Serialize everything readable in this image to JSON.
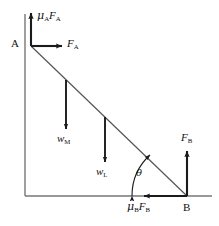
{
  "figure": {
    "background_color": "#ffffff",
    "stroke_color": "#1a1a1a",
    "structure_color": "#6e6e6e",
    "width": 219,
    "height": 226
  },
  "points": [
    {
      "id": "A",
      "label": "A",
      "description": "top contact point of ladder on vertical wall",
      "x": 31,
      "y": 46,
      "label_x": 12,
      "label_y": 39
    },
    {
      "id": "B",
      "label": "B",
      "description": "bottom contact point of ladder on ground",
      "x": 187,
      "y": 196,
      "label_x": 184,
      "label_y": 203
    }
  ],
  "ladder": {
    "name": "ladder-line",
    "from_point": "A",
    "to_point": "B",
    "x1": 31,
    "y1": 46,
    "x2": 187,
    "y2": 196
  },
  "structure": {
    "wall": {
      "x1": 25,
      "y1": 14,
      "x2": 25,
      "y2": 196
    },
    "ground": {
      "x1": 25,
      "y1": 196,
      "x2": 212,
      "y2": 196
    }
  },
  "angle": {
    "symbol": "θ",
    "label": "θ",
    "description": "angle between ladder and ground at B",
    "vertex_x": 187,
    "vertex_y": 196,
    "label_x": 136,
    "label_y": 173,
    "arc_radius": 55
  },
  "forces": [
    {
      "id": "muA_FA",
      "name": "friction-force-at-A",
      "symbol_mu": "μ",
      "symbol_mu_sub": "A",
      "symbol_f": "F",
      "symbol_f_sub": "A",
      "direction": "up",
      "x1": 31,
      "y1": 46,
      "x2": 31,
      "y2": 12,
      "label_x": 37,
      "label_y": 12
    },
    {
      "id": "FA",
      "name": "normal-force-at-A",
      "symbol_f": "F",
      "symbol_f_sub": "A",
      "direction": "right",
      "x1": 31,
      "y1": 46,
      "x2": 63,
      "y2": 46,
      "label_x": 67,
      "label_y": 40
    },
    {
      "id": "wM",
      "name": "weight-of-man",
      "symbol_w": "w",
      "symbol_w_sub": "M",
      "direction": "down",
      "x1": 66,
      "y1": 80,
      "x2": 66,
      "y2": 130,
      "label_x": 58,
      "label_y": 134
    },
    {
      "id": "wL",
      "name": "weight-of-ladder",
      "symbol_w": "w",
      "symbol_w_sub": "L",
      "direction": "down",
      "x1": 105,
      "y1": 117,
      "x2": 105,
      "y2": 163,
      "label_x": 97,
      "label_y": 167
    },
    {
      "id": "FB",
      "name": "normal-force-at-B",
      "symbol_f": "F",
      "symbol_f_sub": "B",
      "direction": "up",
      "x1": 187,
      "y1": 196,
      "x2": 187,
      "y2": 150,
      "label_x": 182,
      "label_y": 134
    },
    {
      "id": "muB_FB",
      "name": "friction-force-at-B",
      "symbol_mu": "μ",
      "symbol_mu_sub": "B",
      "symbol_f": "F",
      "symbol_f_sub": "B",
      "direction": "left",
      "x1": 187,
      "y1": 196,
      "x2": 143,
      "y2": 196,
      "label_x": 128,
      "label_y": 203
    }
  ],
  "labels": {
    "point_a": "A",
    "point_b": "B",
    "mu": "μ",
    "sub_a": "A",
    "sub_b": "B",
    "sub_m": "M",
    "sub_l": "L",
    "f": "F",
    "w": "w",
    "theta": "θ"
  }
}
